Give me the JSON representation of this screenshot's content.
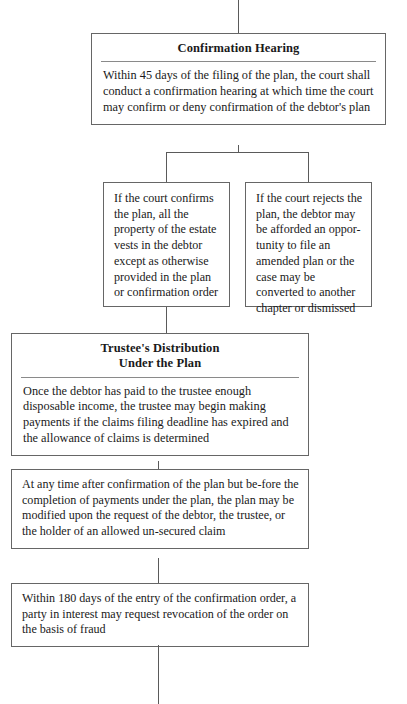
{
  "document": {
    "kind": "flowchart",
    "subject": "Chapter 13 plan confirmation process"
  },
  "nodes": {
    "confirmation_hearing": {
      "title": "Confirmation Hearing",
      "body": "Within 45 days of the filing of the plan, the court shall conduct a confirmation hearing at which time the court may confirm or deny confirmation of the debtor's plan"
    },
    "court_confirms": {
      "body": "If the court confirms the plan, all the property of the estate vests in the debtor except as otherwise provided in the plan or confirmation order"
    },
    "court_rejects": {
      "body": "If the court rejects the plan, the debtor may be afforded an oppor-tunity to file an amended plan or the case may be converted to another chapter or dismissed"
    },
    "trustee_distribution": {
      "title_line1": "Trustee's Distribution",
      "title_line2": "Under the Plan",
      "body": "Once the debtor has paid to the trustee enough disposable income, the trustee may begin making payments if the claims filing deadline has expired and the allowance of claims is determined"
    },
    "plan_modification": {
      "body": "At any time after confirmation of the plan but be-fore the completion of payments under the plan, the plan may be modified upon the request of the debtor, the trustee, or the holder of an allowed un-secured claim"
    },
    "revocation": {
      "body": "Within 180 days of the entry of the confirmation order, a party in interest may request revocation of the order on the basis of fraud"
    }
  },
  "colors": {
    "box_border": "#666666",
    "rule": "#8a8a8a",
    "connector": "#5a5a5a",
    "text": "#1a1a1a",
    "background": "#ffffff"
  }
}
